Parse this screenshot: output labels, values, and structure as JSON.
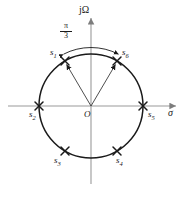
{
  "figure": {
    "type": "s-plane-pole-plot",
    "background_color": "#ffffff",
    "axis_color": "#9a9a9a",
    "curve_color": "#1a1a1a",
    "marker_color": "#1a1a1a"
  },
  "axes": {
    "horizontal": {
      "label": "σ",
      "name": "sigma-axis",
      "x_start": 8,
      "x_end": 178,
      "y": 106,
      "arrow": "right"
    },
    "vertical": {
      "label": "jΩ",
      "name": "j-omega-axis",
      "x": 91,
      "y_start": 184,
      "y_end": 16,
      "arrow": "up"
    },
    "origin": {
      "label": "O",
      "x": 91,
      "y": 106
    }
  },
  "circle": {
    "center_x": 91,
    "center_y": 106,
    "radius": 52,
    "stroke_width": 1.4
  },
  "angle_annotation": {
    "numerator": "π",
    "denominator": "3",
    "label": "π/3",
    "arc_radius": 60,
    "start_angle_deg": 120,
    "end_angle_deg": 60,
    "double_headed": true
  },
  "vectors": [
    {
      "name": "vector-to-s1",
      "to_label": "s1",
      "angle_deg": 120
    },
    {
      "name": "vector-to-s6",
      "to_label": "s6",
      "angle_deg": 60
    }
  ],
  "poles": [
    {
      "id": "s1",
      "base": "s",
      "sub": "1",
      "angle_deg": 120,
      "label_dx": -13,
      "label_dy": -11
    },
    {
      "id": "s2",
      "base": "s",
      "sub": "2",
      "angle_deg": 180,
      "label_dx": -8,
      "label_dy": 6
    },
    {
      "id": "s3",
      "base": "s",
      "sub": "3",
      "angle_deg": 240,
      "label_dx": -13,
      "label_dy": 5
    },
    {
      "id": "s4",
      "base": "s",
      "sub": "4",
      "angle_deg": 300,
      "label_dx": 4,
      "label_dy": 5
    },
    {
      "id": "s5",
      "base": "s",
      "sub": "5",
      "angle_deg": 0,
      "label_dx": 3,
      "label_dy": 6
    },
    {
      "id": "s6",
      "base": "s",
      "sub": "6",
      "angle_deg": 60,
      "label_dx": 5,
      "label_dy": -11
    }
  ],
  "labels": {
    "s1": "s",
    "s1_sub": "1",
    "s2": "s",
    "s2_sub": "2",
    "s3": "s",
    "s3_sub": "3",
    "s4": "s",
    "s4_sub": "4",
    "s5": "s",
    "s5_sub": "5",
    "s6": "s",
    "s6_sub": "6",
    "origin": "O",
    "sigma": "σ",
    "jomega": "jΩ",
    "pi": "π",
    "three": "3"
  }
}
